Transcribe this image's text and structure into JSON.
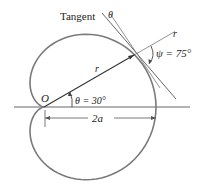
{
  "diagram": {
    "type": "cardioid-polar-tangent",
    "equation_shape": "r = a(1 + cos θ)",
    "labels": {
      "tangent": "Tangent",
      "theta_top": "θ",
      "r_ray": "r",
      "r_segment": "r",
      "psi": "ψ = 75°",
      "origin": "O",
      "theta_angle": "θ = 30°",
      "dimension": "2a"
    },
    "values": {
      "theta_deg": 30,
      "psi_deg": 75
    },
    "colors": {
      "curve": "#7a7a7a",
      "lines": "#555555",
      "text": "#222222"
    }
  }
}
